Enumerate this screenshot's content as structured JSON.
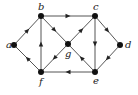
{
  "diagram": {
    "type": "directed-graph",
    "nodes": [
      {
        "id": "a",
        "label": "a",
        "x": 14,
        "y": 45,
        "lx": 6,
        "ly": 48
      },
      {
        "id": "b",
        "label": "b",
        "x": 41,
        "y": 16,
        "lx": 38,
        "ly": 10
      },
      {
        "id": "c",
        "label": "c",
        "x": 95,
        "y": 16,
        "lx": 93,
        "ly": 10
      },
      {
        "id": "d",
        "label": "d",
        "x": 120,
        "y": 45,
        "lx": 125,
        "ly": 48
      },
      {
        "id": "e",
        "label": "e",
        "x": 95,
        "y": 72,
        "lx": 93,
        "ly": 84
      },
      {
        "id": "f",
        "label": "f",
        "x": 41,
        "y": 72,
        "lx": 39,
        "ly": 85
      },
      {
        "id": "g",
        "label": "g",
        "x": 68,
        "y": 44,
        "lx": 65,
        "ly": 57
      }
    ],
    "edges": [
      {
        "from": "a",
        "to": "b"
      },
      {
        "from": "b",
        "to": "c"
      },
      {
        "from": "b",
        "to": "g"
      },
      {
        "from": "f",
        "to": "b"
      },
      {
        "from": "f",
        "to": "a"
      },
      {
        "from": "g",
        "to": "c"
      },
      {
        "from": "g",
        "to": "f"
      },
      {
        "from": "e",
        "to": "g"
      },
      {
        "from": "c",
        "to": "e"
      },
      {
        "from": "c",
        "to": "d"
      },
      {
        "from": "d",
        "to": "e"
      },
      {
        "from": "e",
        "to": "f"
      }
    ],
    "colors": {
      "edge": "#555555",
      "node": "#111111",
      "background": "#ffffff"
    }
  }
}
